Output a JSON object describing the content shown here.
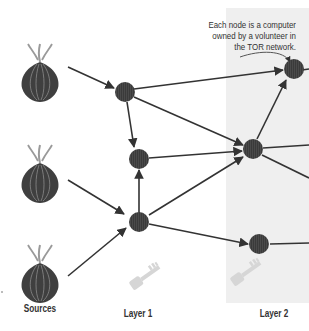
{
  "diagram": {
    "title": "",
    "annotation": {
      "lines": [
        "Each node is a computer",
        "owned by a volunteer in",
        "the TOR network."
      ]
    },
    "columns": {
      "sources": "Sources",
      "layer1": "Layer 1",
      "layer2": "Layer 2"
    },
    "colors": {
      "node": "#3a3a3a",
      "edge": "#333333",
      "layer2_band": "#efefef",
      "key": "#d6d6d6",
      "onion_body": "#3f3f3f",
      "onion_stem": "#9a9a9a"
    },
    "sources": [
      {
        "id": "source-1",
        "icon": "onion-icon"
      },
      {
        "id": "source-2",
        "icon": "onion-icon"
      },
      {
        "id": "source-3",
        "icon": "onion-icon"
      }
    ],
    "nodes": [
      {
        "id": "L1-top",
        "layer": "Layer 1"
      },
      {
        "id": "L1-mid",
        "layer": "Layer 1"
      },
      {
        "id": "L1-bottom",
        "layer": "Layer 1"
      },
      {
        "id": "L2-top",
        "layer": "Layer 2"
      },
      {
        "id": "L2-mid",
        "layer": "Layer 2"
      },
      {
        "id": "L2-bottom",
        "layer": "Layer 2"
      }
    ],
    "edges": [
      {
        "from": "source-1",
        "to": "L1-top"
      },
      {
        "from": "source-2",
        "to": "L1-bottom"
      },
      {
        "from": "source-3",
        "to": "L1-bottom"
      },
      {
        "from": "L1-top",
        "to": "L1-mid"
      },
      {
        "from": "L1-top",
        "to": "L2-top"
      },
      {
        "from": "L1-top",
        "to": "L2-mid"
      },
      {
        "from": "L1-bottom",
        "to": "L1-mid"
      },
      {
        "from": "L1-bottom",
        "to": "L2-mid"
      },
      {
        "from": "L1-bottom",
        "to": "L2-bottom"
      },
      {
        "from": "L1-mid",
        "to": "L2-mid"
      },
      {
        "from": "L2-mid",
        "to": "L2-top"
      }
    ],
    "keys": [
      {
        "id": "key-layer1",
        "icon": "key-icon"
      },
      {
        "id": "key-layer2",
        "icon": "key-icon"
      }
    ]
  }
}
